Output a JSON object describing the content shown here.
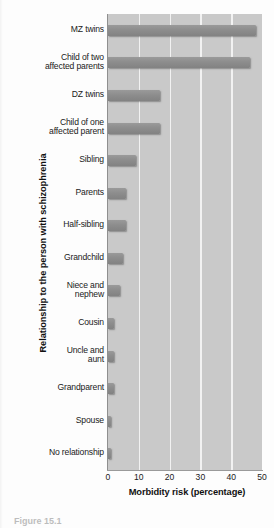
{
  "chart_data": {
    "type": "bar",
    "orientation": "horizontal",
    "title": "",
    "xlabel": "Morbidity risk (percentage)",
    "ylabel": "Relationship to the person with schizophrenia",
    "xlim": [
      0,
      50
    ],
    "xticks": [
      0,
      10,
      20,
      30,
      40,
      50
    ],
    "xtick_labels": [
      "0",
      "10",
      "20",
      "30",
      "40",
      "50"
    ],
    "grid": "vertical-white-gridlines",
    "legend": "none",
    "categories": [
      "MZ twins",
      "Child of two affected parents",
      "DZ twins",
      "Child of one affected parent",
      "Sibling",
      "Parents",
      "Half-sibling",
      "Grandchild",
      "Niece and nephew",
      "Cousin",
      "Uncle and aunt",
      "Grandparent",
      "Spouse",
      "No relationship"
    ],
    "category_lines": [
      [
        "MZ twins"
      ],
      [
        "Child of two",
        "affected parents"
      ],
      [
        "DZ twins"
      ],
      [
        "Child of one",
        "affected parent"
      ],
      [
        "Sibling"
      ],
      [
        "Parents"
      ],
      [
        "Half-sibling"
      ],
      [
        "Grandchild"
      ],
      [
        "Niece and",
        "nephew"
      ],
      [
        "Cousin"
      ],
      [
        "Uncle and",
        "aunt"
      ],
      [
        "Grandparent"
      ],
      [
        "Spouse"
      ],
      [
        "No relationship"
      ]
    ],
    "values": [
      48,
      46,
      17,
      17,
      9,
      6,
      6,
      5,
      4,
      2,
      2,
      2,
      1,
      1
    ],
    "bar_color": "#8d8d8d",
    "plot_background": "#c9c9c9",
    "gridline_color": "#f2f2f2"
  },
  "caption": {
    "text": "Figure 15.1"
  }
}
